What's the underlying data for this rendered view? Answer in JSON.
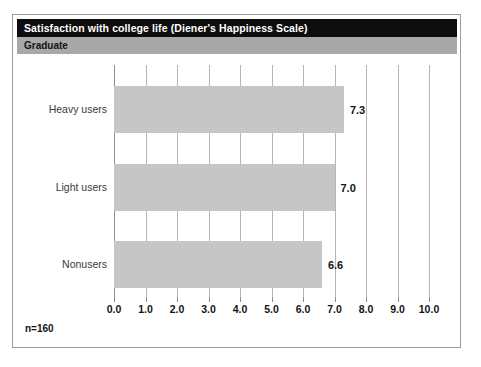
{
  "chart_data": {
    "type": "bar",
    "orientation": "horizontal",
    "title": "Satisfaction with college life (Diener's Happiness Scale)",
    "subtitle": "Graduate",
    "categories": [
      "Heavy users",
      "Light users",
      "Nonusers"
    ],
    "values": [
      7.3,
      7.0,
      6.6
    ],
    "value_labels": [
      "7.3",
      "7.0",
      "6.6"
    ],
    "xlabel": "",
    "ylabel": "",
    "xlim": [
      0.0,
      10.0
    ],
    "xticks": [
      0.0,
      1.0,
      2.0,
      3.0,
      4.0,
      5.0,
      6.0,
      7.0,
      8.0,
      9.0,
      10.0
    ],
    "xtick_labels": [
      "0.0",
      "1.0",
      "2.0",
      "3.0",
      "4.0",
      "5.0",
      "6.0",
      "7.0",
      "8.0",
      "9.0",
      "10.0"
    ],
    "grid": true,
    "grid_axis": "x",
    "legend": null,
    "annotation": "n=160",
    "colors": {
      "bar_fill": "#c6c6c6",
      "title_bar": "#0d0d0d",
      "title_text": "#ffffff",
      "subtitle_bar": "#a8a8a8",
      "subtitle_text": "#141414",
      "gridline": "#b6b6b6",
      "frame_border": "#9a9a9a",
      "value_text": "#131313",
      "category_text": "#3a3a3a"
    }
  }
}
